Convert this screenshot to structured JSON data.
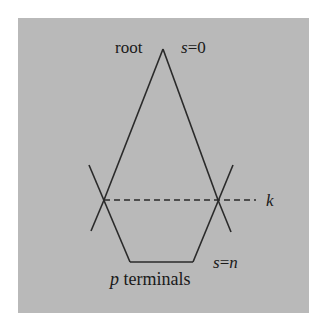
{
  "diagram": {
    "background": "#b9b9b9",
    "stroke": "#2a2a2a",
    "labels": {
      "root": "root",
      "s_top_var": "s",
      "s_top_eq": "=0",
      "k": "k",
      "s_bottom_var": "s",
      "s_bottom_eq": "=",
      "s_bottom_n": "n",
      "p": "p",
      "terminals": " terminals"
    }
  }
}
